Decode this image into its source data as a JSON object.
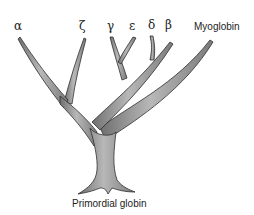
{
  "diagram": {
    "type": "phylogenetic-tree",
    "root_label": "Primordial globin",
    "leaves": [
      {
        "id": "alpha",
        "label": "α"
      },
      {
        "id": "zeta",
        "label": "ζ"
      },
      {
        "id": "gamma",
        "label": "γ"
      },
      {
        "id": "epsilon",
        "label": "ε"
      },
      {
        "id": "delta",
        "label": "δ"
      },
      {
        "id": "beta",
        "label": "β"
      },
      {
        "id": "myoglobin",
        "label": "Myoglobin"
      }
    ],
    "colors": {
      "branch_fill": "#8c8c8c",
      "branch_highlight": "#b5b5b5",
      "branch_outline": "#2e2e2e",
      "text": "#222222",
      "background": "#ffffff"
    }
  }
}
